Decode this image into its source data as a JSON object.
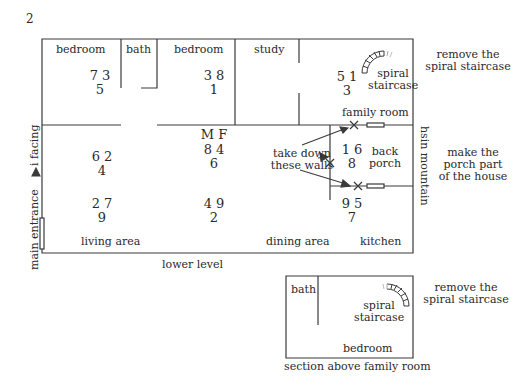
{
  "page_number": "2",
  "lower_level": {
    "caption": "lower level",
    "rooms": {
      "bedroom1": "bedroom",
      "bath": "bath",
      "bedroom2": "bedroom",
      "study": "study",
      "family_room": "family room",
      "back_porch_line1": "back",
      "back_porch_line2": "porch",
      "living_area": "living area",
      "dining_area": "dining area",
      "kitchen": "kitchen",
      "spiral_line1": "spiral",
      "spiral_line2": "staircase"
    },
    "number_groups": [
      {
        "id": "bedroom1",
        "top": "7  3",
        "bottom": "5"
      },
      {
        "id": "bedroom2",
        "top": "3  8",
        "bottom": "1"
      },
      {
        "id": "family-room",
        "top": "5  1",
        "bottom": "3"
      },
      {
        "id": "center-header",
        "top": "M  F"
      },
      {
        "id": "center-upper",
        "top": "8  4",
        "bottom": "6"
      },
      {
        "id": "living-upper",
        "top": "6  2",
        "bottom": "4"
      },
      {
        "id": "living-lower",
        "top": "2  7",
        "bottom": "9"
      },
      {
        "id": "center-lower",
        "top": "4  9",
        "bottom": "2"
      },
      {
        "id": "porch",
        "top": "1  6",
        "bottom": "8"
      },
      {
        "id": "kitchen",
        "top": "9  5",
        "bottom": "7"
      }
    ],
    "side_labels": {
      "facing": "i facing",
      "main_entrance": "main entrance",
      "mountain": "hsin mountain"
    },
    "annotations": {
      "take_down_line1": "take down",
      "take_down_line2": "these walls",
      "remove_line1": "remove the",
      "remove_line2": "spiral staircase",
      "porch_line1": "make the",
      "porch_line2": "porch part",
      "porch_line3": "of the house"
    }
  },
  "upper_section": {
    "caption": "section above family room",
    "rooms": {
      "bath": "bath",
      "bedroom": "bedroom",
      "spiral_line1": "spiral",
      "spiral_line2": "staircase"
    },
    "annotations": {
      "remove_line1": "remove the",
      "remove_line2": "spiral staircase"
    }
  },
  "colors": {
    "line": "#3a3a3a",
    "text": "#2a2a2a",
    "background": "#ffffff"
  }
}
